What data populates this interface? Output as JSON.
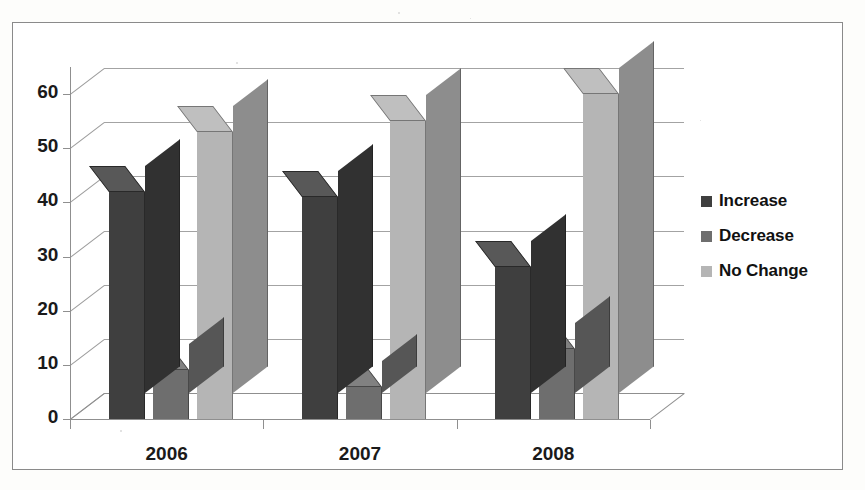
{
  "chart_data": {
    "type": "bar",
    "title": "",
    "subtitle": "",
    "xlabel": "",
    "ylabel": "",
    "categories": [
      "2006",
      "2007",
      "2008"
    ],
    "series": [
      {
        "name": "Increase",
        "values": [
          42,
          41,
          28
        ],
        "color": "#3f3f3f"
      },
      {
        "name": "Decrease",
        "values": [
          9,
          6,
          13
        ],
        "color": "#6e6e6e"
      },
      {
        "name": "No Change",
        "values": [
          53,
          55,
          60
        ],
        "color": "#b5b5b5"
      }
    ],
    "yticks": [
      0,
      10,
      20,
      30,
      40,
      50,
      60
    ],
    "ytick_labels": [
      "0",
      "10",
      "20",
      "30",
      "40",
      "50",
      "60"
    ],
    "ylim": [
      0,
      65
    ],
    "grid": true,
    "legend_position": "right",
    "three_d": true,
    "annotations": []
  },
  "legend": {
    "items": [
      {
        "label": "Increase",
        "swatch": "#3f3f3f"
      },
      {
        "label": "Decrease",
        "swatch": "#6e6e6e"
      },
      {
        "label": "No Change",
        "swatch": "#b5b5b5"
      }
    ]
  },
  "axes": {
    "y_tick_labels": [
      "60",
      "50",
      "40",
      "30",
      "20",
      "10",
      "0"
    ],
    "x_tick_labels": [
      "2006",
      "2007",
      "2008"
    ]
  },
  "colors": {
    "increase": "#3f3f3f",
    "decrease": "#6e6e6e",
    "no_change": "#b5b5b5",
    "grid": "#9b9b9b",
    "axis": "#8f8f8f",
    "border": "#8a8a8a",
    "background": "#ffffff"
  }
}
